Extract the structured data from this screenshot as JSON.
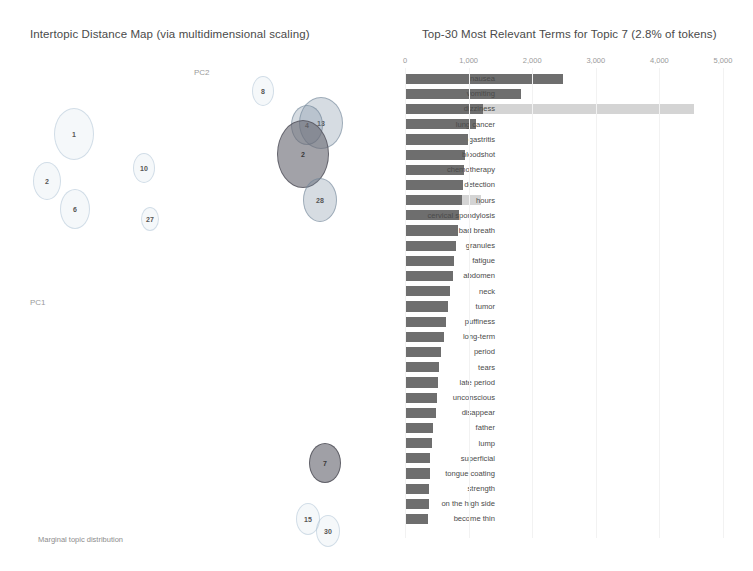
{
  "left": {
    "title": "Intertopic Distance Map (via multidimensional scaling)",
    "pc2_label": "PC2",
    "pc1_label": "PC1",
    "marginal_label": "Marginal topic distribution",
    "topics": [
      {
        "id": "1",
        "x": 74,
        "y": 134,
        "rx": 20,
        "ry": 26,
        "style": "b-pale"
      },
      {
        "id": "2",
        "x": 47,
        "y": 181,
        "rx": 14,
        "ry": 19,
        "style": "b-pale"
      },
      {
        "id": "6",
        "x": 75,
        "y": 209,
        "rx": 15,
        "ry": 20,
        "style": "b-pale"
      },
      {
        "id": "10",
        "x": 144,
        "y": 168,
        "rx": 11,
        "ry": 15,
        "style": "b-pale"
      },
      {
        "id": "27",
        "x": 150,
        "y": 219,
        "rx": 9,
        "ry": 12,
        "style": "b-pale"
      },
      {
        "id": "8",
        "x": 263,
        "y": 91,
        "rx": 11,
        "ry": 15,
        "style": "b-pale"
      },
      {
        "id": "13",
        "x": 321,
        "y": 123,
        "rx": 22,
        "ry": 26,
        "style": "b-mid"
      },
      {
        "id": "4",
        "x": 307,
        "y": 125,
        "rx": 16,
        "ry": 20,
        "style": "b-mid"
      },
      {
        "id": "2b",
        "x": 303,
        "y": 154,
        "rx": 26,
        "ry": 34,
        "style": "b-dark",
        "label": "2"
      },
      {
        "id": "28",
        "x": 320,
        "y": 200,
        "rx": 17,
        "ry": 22,
        "style": "b-mid"
      },
      {
        "id": "7",
        "x": 325,
        "y": 463,
        "rx": 16,
        "ry": 20,
        "style": "b-sel"
      },
      {
        "id": "15",
        "x": 308,
        "y": 519,
        "rx": 12,
        "ry": 16,
        "style": "b-pale"
      },
      {
        "id": "30",
        "x": 328,
        "y": 531,
        "rx": 12,
        "ry": 16,
        "style": "b-pale"
      }
    ]
  },
  "right": {
    "title": "Top-30 Most Relevant Terms for Topic 7 (2.8% of tokens)"
  },
  "chart_data": {
    "type": "bar",
    "orientation": "horizontal",
    "title": "Top-30 Most Relevant Terms for Topic 7 (2.8% of tokens)",
    "xlabel": "",
    "ylabel": "",
    "xlim": [
      0,
      5000
    ],
    "ticks": [
      {
        "value": 0,
        "label": "0"
      },
      {
        "value": 1000,
        "label": "1,000"
      },
      {
        "value": 2000,
        "label": "2,000"
      },
      {
        "value": 3000,
        "label": "3,000"
      },
      {
        "value": 4000,
        "label": "4,000"
      },
      {
        "value": 5000,
        "label": "5,000"
      }
    ],
    "grid": false,
    "legend": [],
    "series": [
      {
        "name": "Overall term frequency",
        "color": "#d4d4d4"
      },
      {
        "name": "Estimated term frequency within topic",
        "color": "#6e6e6e"
      }
    ],
    "categories": [
      "nausea",
      "vomiting",
      "dizziness",
      "lung cancer",
      "gastritis",
      "bloodshot",
      "chemotherapy",
      "detection",
      "hours",
      "cervical spondylosis",
      "bad breath",
      "granules",
      "fatigue",
      "abdomen",
      "neck",
      "tumor",
      "puffiness",
      "long-term",
      "period",
      "tears",
      "late period",
      "unconscious",
      "disappear",
      "father",
      "lump",
      "superficial",
      "tongue coating",
      "strength",
      "on the high side",
      "become thin"
    ],
    "overall": [
      2480,
      1820,
      4540,
      1110,
      990,
      940,
      920,
      910,
      1200,
      850,
      830,
      800,
      770,
      750,
      700,
      680,
      650,
      620,
      560,
      540,
      520,
      500,
      480,
      440,
      420,
      400,
      390,
      380,
      370,
      360
    ],
    "within": [
      2480,
      1820,
      1230,
      1110,
      990,
      940,
      920,
      910,
      890,
      850,
      830,
      800,
      770,
      750,
      700,
      680,
      650,
      620,
      560,
      540,
      520,
      500,
      480,
      440,
      420,
      400,
      390,
      380,
      370,
      360
    ]
  }
}
